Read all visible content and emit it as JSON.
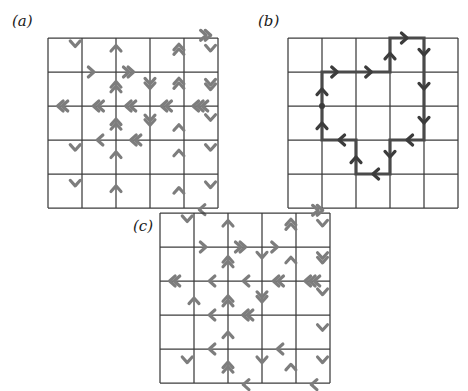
{
  "figure": {
    "panels": [
      {
        "id": "a",
        "label": "(a)",
        "label_x": 12,
        "label_y": 14,
        "x": 48,
        "y": 38,
        "cols": 5,
        "rows": 5,
        "cell": 34
      },
      {
        "id": "b",
        "label": "(b)",
        "label_x": 258,
        "label_y": 14,
        "x": 288,
        "y": 38,
        "cols": 5,
        "rows": 5,
        "cell": 34
      },
      {
        "id": "c",
        "label": "(c)",
        "label_x": 133,
        "label_y": 218,
        "x": 160,
        "y": 213,
        "cols": 5,
        "rows": 5,
        "cell": 34
      }
    ],
    "colors": {
      "grid_line": "#3c3c3c",
      "arrow_grey": "#7d7d7d",
      "path_dark": "#3c3c3c",
      "background": "#ffffff",
      "label_text": "#1a1a1a"
    },
    "arrow_glyph": "chevron"
  },
  "panel_a_arrows": [
    {
      "cx": 0.8,
      "cy": 0.25,
      "dir": "down",
      "n": 1
    },
    {
      "cx": 2.0,
      "cy": 0.22,
      "dir": "up",
      "n": 1
    },
    {
      "cx": 3.85,
      "cy": 0.25,
      "dir": "up",
      "n": 2
    },
    {
      "cx": 4.72,
      "cy": -0.08,
      "dir": "right",
      "n": 2
    },
    {
      "cx": 4.78,
      "cy": 0.38,
      "dir": "down",
      "n": 1
    },
    {
      "cx": 1.35,
      "cy": 1.0,
      "dir": "right",
      "n": 1
    },
    {
      "cx": 2.45,
      "cy": 1.0,
      "dir": "right",
      "n": 2
    },
    {
      "cx": 2.0,
      "cy": 1.35,
      "dir": "up",
      "n": 2
    },
    {
      "cx": 3.0,
      "cy": 1.42,
      "dir": "down",
      "n": 2
    },
    {
      "cx": 3.85,
      "cy": 1.25,
      "dir": "up",
      "n": 2
    },
    {
      "cx": 4.78,
      "cy": 1.45,
      "dir": "down",
      "n": 2
    },
    {
      "cx": 0.35,
      "cy": 2.0,
      "dir": "left",
      "n": 2
    },
    {
      "cx": 1.4,
      "cy": 2.0,
      "dir": "left",
      "n": 2
    },
    {
      "cx": 2.35,
      "cy": 2.0,
      "dir": "left",
      "n": 2
    },
    {
      "cx": 3.4,
      "cy": 2.0,
      "dir": "left",
      "n": 2
    },
    {
      "cx": 4.4,
      "cy": 2.0,
      "dir": "left",
      "n": 3
    },
    {
      "cx": 4.78,
      "cy": 2.42,
      "dir": "down",
      "n": 1
    },
    {
      "cx": 2.0,
      "cy": 2.45,
      "dir": "up",
      "n": 2
    },
    {
      "cx": 3.0,
      "cy": 2.5,
      "dir": "down",
      "n": 2
    },
    {
      "cx": 3.85,
      "cy": 2.55,
      "dir": "up",
      "n": 1
    },
    {
      "cx": 1.45,
      "cy": 3.0,
      "dir": "left",
      "n": 1
    },
    {
      "cx": 2.5,
      "cy": 3.0,
      "dir": "left",
      "n": 2
    },
    {
      "cx": 0.8,
      "cy": 3.3,
      "dir": "down",
      "n": 1
    },
    {
      "cx": 2.0,
      "cy": 3.35,
      "dir": "up",
      "n": 1
    },
    {
      "cx": 3.85,
      "cy": 3.3,
      "dir": "up",
      "n": 1
    },
    {
      "cx": 4.78,
      "cy": 3.3,
      "dir": "down",
      "n": 1
    },
    {
      "cx": 0.8,
      "cy": 4.35,
      "dir": "down",
      "n": 1
    },
    {
      "cx": 2.0,
      "cy": 4.35,
      "dir": "up",
      "n": 1
    },
    {
      "cx": 3.85,
      "cy": 4.4,
      "dir": "up",
      "n": 1
    },
    {
      "cx": 4.78,
      "cy": 4.4,
      "dir": "down",
      "n": 1
    },
    {
      "cx": 4.45,
      "cy": 5.05,
      "dir": "left",
      "n": 1
    }
  ],
  "panel_b_path": {
    "vertices": [
      [
        1,
        3
      ],
      [
        1,
        2
      ],
      [
        2,
        2
      ],
      [
        3,
        2
      ],
      [
        3,
        1
      ],
      [
        4,
        1
      ],
      [
        4,
        2
      ],
      [
        4,
        3
      ],
      [
        4,
        4
      ],
      [
        3,
        4
      ],
      [
        3,
        5
      ],
      [
        2,
        5
      ],
      [
        2,
        4
      ],
      [
        1,
        4
      ],
      [
        1,
        3
      ]
    ],
    "marked_vertex": [
      1,
      3
    ],
    "arrows": [
      {
        "cx": 1.0,
        "cy": 2.5,
        "dir": "up"
      },
      {
        "cx": 1.45,
        "cy": 2.0,
        "dir": "right"
      },
      {
        "cx": 2.45,
        "cy": 2.0,
        "dir": "right"
      },
      {
        "cx": 3.0,
        "cy": 1.45,
        "dir": "up"
      },
      {
        "cx": 3.5,
        "cy": 1.0,
        "dir": "right"
      },
      {
        "cx": 4.0,
        "cy": 1.5,
        "dir": "down"
      },
      {
        "cx": 4.0,
        "cy": 2.5,
        "dir": "down"
      },
      {
        "cx": 4.0,
        "cy": 3.5,
        "dir": "down"
      },
      {
        "cx": 3.5,
        "cy": 4.0,
        "dir": "left"
      },
      {
        "cx": 3.0,
        "cy": 4.5,
        "dir": "down"
      },
      {
        "cx": 2.5,
        "cy": 5.0,
        "dir": "left"
      },
      {
        "cx": 2.0,
        "cy": 4.5,
        "dir": "up"
      },
      {
        "cx": 1.5,
        "cy": 4.0,
        "dir": "left"
      },
      {
        "cx": 1.0,
        "cy": 3.5,
        "dir": "up"
      }
    ]
  },
  "panel_c_arrows": [
    {
      "cx": 0.8,
      "cy": 0.25,
      "dir": "down",
      "n": 1
    },
    {
      "cx": 2.0,
      "cy": 0.22,
      "dir": "up",
      "n": 1
    },
    {
      "cx": 3.85,
      "cy": 0.25,
      "dir": "up",
      "n": 2
    },
    {
      "cx": 4.72,
      "cy": -0.08,
      "dir": "right",
      "n": 2
    },
    {
      "cx": 4.78,
      "cy": 0.38,
      "dir": "down",
      "n": 1
    },
    {
      "cx": 1.35,
      "cy": 1.0,
      "dir": "right",
      "n": 1
    },
    {
      "cx": 2.45,
      "cy": 1.0,
      "dir": "right",
      "n": 2
    },
    {
      "cx": 3.45,
      "cy": 1.0,
      "dir": "right",
      "n": 1
    },
    {
      "cx": 2.0,
      "cy": 1.35,
      "dir": "up",
      "n": 2
    },
    {
      "cx": 3.0,
      "cy": 1.32,
      "dir": "down",
      "n": 1
    },
    {
      "cx": 3.85,
      "cy": 1.3,
      "dir": "up",
      "n": 1
    },
    {
      "cx": 4.78,
      "cy": 1.4,
      "dir": "down",
      "n": 2
    },
    {
      "cx": 0.35,
      "cy": 2.0,
      "dir": "left",
      "n": 2
    },
    {
      "cx": 1.45,
      "cy": 2.0,
      "dir": "left",
      "n": 1
    },
    {
      "cx": 2.45,
      "cy": 2.0,
      "dir": "left",
      "n": 1
    },
    {
      "cx": 3.4,
      "cy": 2.0,
      "dir": "left",
      "n": 2
    },
    {
      "cx": 4.4,
      "cy": 2.0,
      "dir": "left",
      "n": 3
    },
    {
      "cx": 4.78,
      "cy": 2.4,
      "dir": "down",
      "n": 1
    },
    {
      "cx": 1.0,
      "cy": 2.5,
      "dir": "up",
      "n": 1
    },
    {
      "cx": 2.0,
      "cy": 2.5,
      "dir": "up",
      "n": 2
    },
    {
      "cx": 3.0,
      "cy": 2.55,
      "dir": "down",
      "n": 2
    },
    {
      "cx": 1.45,
      "cy": 3.0,
      "dir": "left",
      "n": 1
    },
    {
      "cx": 2.5,
      "cy": 3.0,
      "dir": "left",
      "n": 2
    },
    {
      "cx": 2.0,
      "cy": 3.5,
      "dir": "up",
      "n": 1
    },
    {
      "cx": 4.78,
      "cy": 3.45,
      "dir": "down",
      "n": 1
    },
    {
      "cx": 1.45,
      "cy": 4.0,
      "dir": "left",
      "n": 1
    },
    {
      "cx": 3.45,
      "cy": 4.0,
      "dir": "left",
      "n": 1
    },
    {
      "cx": 0.8,
      "cy": 4.4,
      "dir": "down",
      "n": 1
    },
    {
      "cx": 2.0,
      "cy": 4.45,
      "dir": "up",
      "n": 2
    },
    {
      "cx": 3.0,
      "cy": 4.4,
      "dir": "down",
      "n": 1
    },
    {
      "cx": 3.85,
      "cy": 4.45,
      "dir": "up",
      "n": 1
    },
    {
      "cx": 4.78,
      "cy": 4.4,
      "dir": "down",
      "n": 1
    },
    {
      "cx": 2.45,
      "cy": 5.05,
      "dir": "left",
      "n": 1
    },
    {
      "cx": 4.45,
      "cy": 5.05,
      "dir": "left",
      "n": 1
    }
  ]
}
